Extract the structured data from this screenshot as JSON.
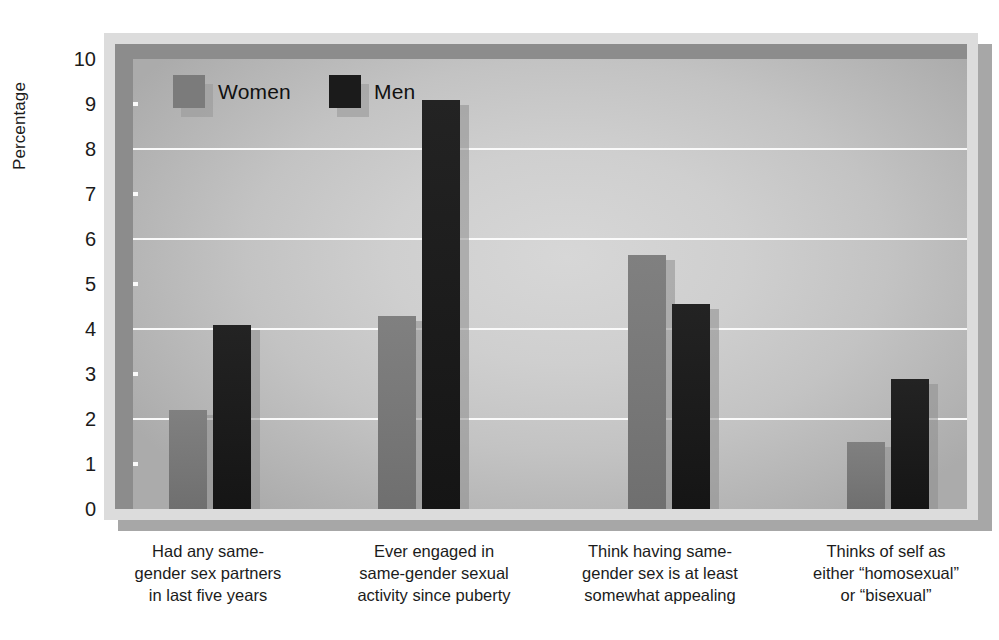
{
  "chart_data": {
    "type": "bar",
    "title": "",
    "xlabel": "",
    "ylabel": "Percentage",
    "ylim": [
      0,
      10
    ],
    "ytick_labels": [
      "0",
      "1",
      "2",
      "3",
      "4",
      "5",
      "6",
      "7",
      "8",
      "9",
      "10"
    ],
    "ytick_values": [
      0,
      1,
      2,
      3,
      4,
      5,
      6,
      7,
      8,
      9,
      10
    ],
    "gridline_values": [
      2,
      4,
      6,
      8
    ],
    "tickmark_values": [
      1,
      3,
      5,
      7,
      9
    ],
    "grid": true,
    "legend_position": "inside top-left",
    "categories": [
      "Had any same-gender sex partners in last five years",
      "Ever engaged in same-gender sexual activity since puberty",
      "Think having same-gender sex is at least somewhat appealing",
      "Thinks of self as either “homosexual” or “bisexual”"
    ],
    "category_lines": [
      [
        "Had any same-",
        "gender sex partners",
        "in last five years"
      ],
      [
        "Ever engaged in",
        "same-gender sexual",
        "activity since puberty"
      ],
      [
        "Think having same-",
        "gender sex is at least",
        "somewhat appealing"
      ],
      [
        "Thinks of self as",
        "either “homosexual”",
        "or “bisexual”"
      ]
    ],
    "series": [
      {
        "name": "Women",
        "color": "#7b7b7b",
        "values": [
          2.2,
          4.3,
          5.65,
          1.5
        ]
      },
      {
        "name": "Men",
        "color": "#1b1b1b",
        "values": [
          4.1,
          9.1,
          4.55,
          2.9
        ]
      }
    ]
  },
  "legend": {
    "items": [
      {
        "label": "Women",
        "key": "women"
      },
      {
        "label": "Men",
        "key": "men"
      }
    ]
  },
  "colors": {
    "women_bar": "#7b7b7b",
    "men_bar": "#1b1b1b",
    "gridline": "#fcfcfc",
    "axis_frame": "#8c8c8c",
    "plate": "#dcdcdc",
    "plot_background": "#cfcfcf",
    "text": "#1b1b1b"
  }
}
